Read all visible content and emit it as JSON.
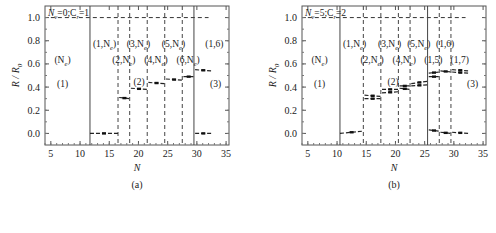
{
  "chart_data": [
    {
      "type": "line",
      "panel_label": "(a)",
      "annotation": "N_v=0;C_r=1",
      "xlabel": "N",
      "ylabel": "R / R_0",
      "xlim": [
        4,
        35.5
      ],
      "ylim": [
        -0.1,
        1.1
      ],
      "xticks": [
        "5",
        "10",
        "15",
        "20",
        "25",
        "30",
        "35"
      ],
      "yticks": [
        "0.0",
        "0.2",
        "0.4",
        "0.6",
        "0.8",
        "1.0"
      ],
      "reference_line": {
        "y": 1.0,
        "x_range": [
          5,
          32
        ],
        "style": "dashed"
      },
      "solid_vlines": [
        11.7,
        29.5
      ],
      "dashed_vlines": [
        16.5,
        18.5,
        21.5,
        24.5,
        27.5
      ],
      "region_labels": [
        {
          "text": "(N_e)",
          "x": 7.0,
          "y": 0.63
        },
        {
          "text": "(1)",
          "x": 7.0,
          "y": 0.43
        },
        {
          "text": "(1,N_e)",
          "x": 14.2,
          "y": 0.77
        },
        {
          "text": "(2,N_e)",
          "x": 17.5,
          "y": 0.63
        },
        {
          "text": "(3,N_e)",
          "x": 20.0,
          "y": 0.77
        },
        {
          "text": "(4,N_e)",
          "x": 23.0,
          "y": 0.63
        },
        {
          "text": "(5,N_e)",
          "x": 26.0,
          "y": 0.77
        },
        {
          "text": "(6,N_e)",
          "x": 28.5,
          "y": 0.63
        },
        {
          "text": "(1,6)",
          "x": 33.0,
          "y": 0.77
        },
        {
          "text": "(2)",
          "x": 20.1,
          "y": 0.44
        },
        {
          "text": "(3)",
          "x": 33.2,
          "y": 0.43
        }
      ],
      "series": [
        {
          "name": "R/R0",
          "segments": [
            {
              "x": [
                11.7,
                16.5
              ],
              "y": [
                0.0,
                0.0
              ]
            },
            {
              "x": [
                16.7,
                18.5
              ],
              "y": [
                0.31,
                0.3
              ]
            },
            {
              "x": [
                18.7,
                21.5
              ],
              "y": [
                0.39,
                0.38
              ]
            },
            {
              "x": [
                21.7,
                24.5
              ],
              "y": [
                0.44,
                0.43
              ]
            },
            {
              "x": [
                24.7,
                27.5
              ],
              "y": [
                0.47,
                0.46
              ]
            },
            {
              "x": [
                27.7,
                29.5
              ],
              "y": [
                0.49,
                0.49
              ]
            },
            {
              "x": [
                29.7,
                32.5
              ],
              "y": [
                0.55,
                0.54
              ]
            },
            {
              "x": [
                29.7,
                32.5
              ],
              "y": [
                0.0,
                0.0
              ]
            }
          ]
        }
      ]
    },
    {
      "type": "line",
      "panel_label": "(b)",
      "annotation": "N_v=5;C_r=2",
      "xlabel": "N",
      "ylabel": "R / R_0",
      "xlim": [
        4,
        35.5
      ],
      "ylim": [
        -0.1,
        1.1
      ],
      "xticks": [
        "5",
        "10",
        "15",
        "20",
        "25",
        "30",
        "35"
      ],
      "yticks": [
        "0.0",
        "0.2",
        "0.4",
        "0.6",
        "0.8",
        "1.0"
      ],
      "reference_line": {
        "y": 1.0,
        "x_range": [
          5,
          32
        ],
        "style": "dashed"
      },
      "solid_vlines": [
        10.5,
        25.5
      ],
      "dashed_vlines": [
        14.5,
        17.5,
        20.5,
        22.5,
        27.5,
        29.5
      ],
      "region_labels": [
        {
          "text": "(N_e)",
          "x": 7.0,
          "y": 0.63
        },
        {
          "text": "(1)",
          "x": 7.0,
          "y": 0.43
        },
        {
          "text": "(1,N_e)",
          "x": 13.0,
          "y": 0.77
        },
        {
          "text": "(2,N_e)",
          "x": 16.0,
          "y": 0.63
        },
        {
          "text": "(3,N_e)",
          "x": 19.0,
          "y": 0.77
        },
        {
          "text": "(4,N_e)",
          "x": 21.5,
          "y": 0.63
        },
        {
          "text": "(5,N_e)",
          "x": 24.0,
          "y": 0.77
        },
        {
          "text": "(1,6)",
          "x": 28.5,
          "y": 0.77
        },
        {
          "text": "(1,5)",
          "x": 26.5,
          "y": 0.63
        },
        {
          "text": "(1,7)",
          "x": 31.0,
          "y": 0.63
        },
        {
          "text": "(2)",
          "x": 19.6,
          "y": 0.44
        },
        {
          "text": "(3)",
          "x": 33.2,
          "y": 0.43
        }
      ],
      "series": [
        {
          "name": "R/R0",
          "segments": [
            {
              "x": [
                10.5,
                14.5
              ],
              "y": [
                0.0,
                0.02
              ]
            },
            {
              "x": [
                14.7,
                17.5
              ],
              "y": [
                0.33,
                0.32
              ]
            },
            {
              "x": [
                14.7,
                17.5
              ],
              "y": [
                0.3,
                0.3
              ]
            },
            {
              "x": [
                17.7,
                20.5
              ],
              "y": [
                0.38,
                0.38
              ]
            },
            {
              "x": [
                17.7,
                20.5
              ],
              "y": [
                0.35,
                0.36
              ]
            },
            {
              "x": [
                20.7,
                22.5
              ],
              "y": [
                0.39,
                0.38
              ]
            },
            {
              "x": [
                20.7,
                22.5
              ],
              "y": [
                0.41,
                0.41
              ]
            },
            {
              "x": [
                22.7,
                25.5
              ],
              "y": [
                0.43,
                0.45
              ]
            },
            {
              "x": [
                22.7,
                25.5
              ],
              "y": [
                0.41,
                0.42
              ]
            },
            {
              "x": [
                25.7,
                27.5
              ],
              "y": [
                0.52,
                0.53
              ]
            },
            {
              "x": [
                25.7,
                27.5
              ],
              "y": [
                0.49,
                0.49
              ]
            },
            {
              "x": [
                27.7,
                29.5
              ],
              "y": [
                0.54,
                0.53
              ]
            },
            {
              "x": [
                29.7,
                32.5
              ],
              "y": [
                0.55,
                0.54
              ]
            },
            {
              "x": [
                29.7,
                32.5
              ],
              "y": [
                0.53,
                0.52
              ]
            },
            {
              "x": [
                25.7,
                27.5
              ],
              "y": [
                0.03,
                0.02
              ]
            },
            {
              "x": [
                27.7,
                29.5
              ],
              "y": [
                0.01,
                0.0
              ]
            },
            {
              "x": [
                29.7,
                32.5
              ],
              "y": [
                0.01,
                0.0
              ]
            }
          ]
        }
      ]
    }
  ]
}
